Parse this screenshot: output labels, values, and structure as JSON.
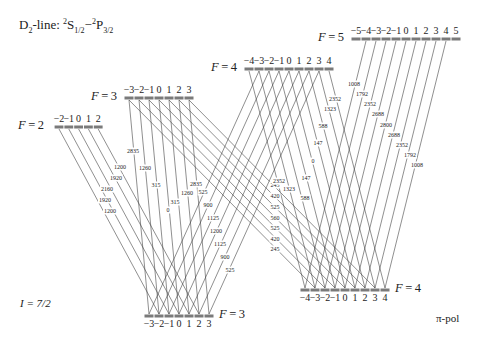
{
  "title": {
    "prefix": "D",
    "sub1": "2",
    "mid": "-line: ",
    "sup1": "2",
    "S": "S",
    "sub2": "1/2",
    "dash": "−",
    "sup2": "2",
    "P": "P",
    "sub3": "3/2"
  },
  "nuclear_spin": "I = 7/2",
  "polarization": "π-pol",
  "colors": {
    "line": "#333333",
    "bar": "#7a7a7a",
    "text": "#222222"
  },
  "levels": {
    "upper": [
      {
        "F": "F = 2",
        "y": 127,
        "x0": 59,
        "dx": 9.8,
        "m": [
          "−2",
          "−1",
          "0",
          "1",
          "2"
        ],
        "label_x": 18
      },
      {
        "F": "F = 3",
        "y": 98,
        "x0": 129,
        "dx": 10,
        "m": [
          "−3",
          "−2",
          "−1",
          "0",
          "1",
          "2",
          "3"
        ],
        "label_x": 91
      },
      {
        "F": "F = 4",
        "y": 69,
        "x0": 249,
        "dx": 10,
        "m": [
          "−4",
          "−3",
          "−2",
          "−1",
          "0",
          "1",
          "2",
          "3",
          "4"
        ],
        "label_x": 211
      },
      {
        "F": "F = 5",
        "y": 39,
        "x0": 356,
        "dx": 10,
        "m": [
          "−5",
          "−4",
          "−3",
          "−2",
          "−1",
          "0",
          "1",
          "2",
          "3",
          "4",
          "5"
        ],
        "label_x": 318
      }
    ],
    "lower": [
      {
        "F": "F = 3",
        "y": 316,
        "x0": 149,
        "dx": 10,
        "m": [
          "−3",
          "−2",
          "−1",
          "0",
          "1",
          "2",
          "3"
        ],
        "label_x": 219
      },
      {
        "F": "F = 4",
        "y": 290,
        "x0": 305,
        "dx": 10,
        "m": [
          "−4",
          "−3",
          "−2",
          "−1",
          "0",
          "1",
          "2",
          "3",
          "4"
        ],
        "label_x": 395
      }
    ]
  },
  "transitions": [
    {
      "from": "F'=2",
      "to": "F=3",
      "coefficients": [
        "1200",
        "1920",
        "2160",
        "1920",
        "1200"
      ],
      "label_pos": [
        [
          120,
          167
        ],
        [
          116,
          178
        ],
        [
          107,
          189
        ],
        [
          105,
          200
        ],
        [
          110,
          211
        ]
      ]
    },
    {
      "from": "F'=3",
      "to": "F=3",
      "coefficients": [
        "2835",
        "1260",
        "315",
        "0",
        "315",
        "1260",
        "2835"
      ],
      "label_pos": [
        [
          133,
          151
        ],
        [
          145,
          168
        ],
        [
          156,
          185
        ],
        [
          168,
          210
        ],
        [
          175,
          202
        ],
        [
          187,
          193
        ],
        [
          196,
          184
        ]
      ]
    },
    {
      "from": "F'=4",
      "to": "F=3",
      "coefficients": [
        "525",
        "900",
        "1125",
        "1200",
        "1125",
        "900",
        "525"
      ],
      "label_pos": [
        [
          203,
          192
        ],
        [
          208,
          205
        ],
        [
          213,
          218
        ],
        [
          216,
          231
        ],
        [
          220,
          244
        ],
        [
          225,
          257
        ],
        [
          230,
          270
        ]
      ]
    },
    {
      "from": "F'=3",
      "to": "F=4",
      "coefficients": [
        "245",
        "420",
        "525",
        "560",
        "525",
        "420",
        "245"
      ],
      "label_pos": [
        [
          275,
          249
        ],
        [
          275,
          239
        ],
        [
          275,
          228
        ],
        [
          275,
          218
        ],
        [
          275,
          207
        ],
        [
          275,
          196
        ],
        [
          275,
          185
        ]
      ]
    },
    {
      "from": "F'=4",
      "to": "F=4",
      "coefficients": [
        "2352",
        "1323",
        "588",
        "147",
        "0",
        "147",
        "588",
        "1323",
        "2352"
      ],
      "label_pos": [
        [
          279,
          181
        ],
        [
          289,
          189
        ],
        [
          305,
          198
        ],
        [
          306,
          178
        ],
        [
          313,
          161
        ],
        [
          318,
          143
        ],
        [
          323,
          126
        ],
        [
          330,
          109
        ],
        [
          335,
          99
        ]
      ]
    },
    {
      "from": "F'=5",
      "to": "F=4",
      "coefficients": [
        "1008",
        "1792",
        "2352",
        "2688",
        "2800",
        "2688",
        "2352",
        "1792",
        "1008"
      ],
      "label_pos": [
        [
          354,
          84
        ],
        [
          362,
          94
        ],
        [
          370,
          104
        ],
        [
          378,
          114
        ],
        [
          386,
          125
        ],
        [
          394,
          135
        ],
        [
          402,
          145
        ],
        [
          410,
          155
        ],
        [
          417,
          165
        ]
      ]
    }
  ]
}
